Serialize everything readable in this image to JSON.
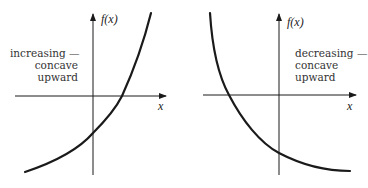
{
  "panels": [
    {
      "id": "left",
      "y_axis_label": "f(x)",
      "x_axis_label": "x",
      "description_lines": [
        "increasing —",
        "concave",
        "upward"
      ],
      "curve": "increasing exponential, concave upward"
    },
    {
      "id": "right",
      "y_axis_label": "f(x)",
      "x_axis_label": "x",
      "description_lines": [
        "decreasing —",
        "concave",
        "upward"
      ],
      "curve": "decreasing exponential decay, concave upward"
    }
  ],
  "colors": {
    "stroke": "#1a1a1a",
    "text": "#333333",
    "background": "#ffffff"
  }
}
